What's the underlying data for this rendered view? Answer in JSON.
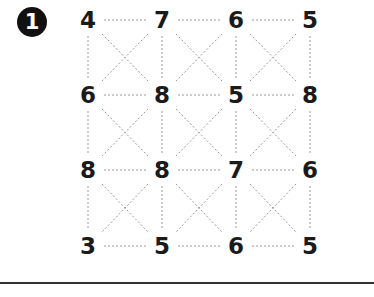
{
  "problem": {
    "number_label": "1",
    "grid": [
      [
        "4",
        "7",
        "6",
        "5"
      ],
      [
        "6",
        "8",
        "5",
        "8"
      ],
      [
        "8",
        "8",
        "7",
        "6"
      ],
      [
        "3",
        "5",
        "6",
        "5"
      ]
    ],
    "connector_style": "dotted",
    "connections": "horizontal, vertical, and diagonal X between adjacent numbers in each cell"
  },
  "colors": {
    "text": "#1a1a1a",
    "dotted_line": "#9a9a9a",
    "badge_bg": "#111111",
    "rule": "#333333"
  }
}
